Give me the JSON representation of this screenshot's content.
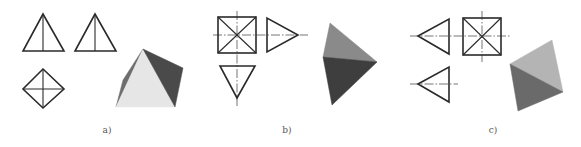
{
  "figure": {
    "panels": [
      {
        "id": "a",
        "label": "a)",
        "description": "Square pyramid: front view, side view, top view and shaded 3D view",
        "views": {
          "front": {
            "type": "triangle-with-vertical-edge",
            "points": [
              [
                43,
                14
              ],
              [
                23,
                51
              ],
              [
                64,
                51
              ]
            ],
            "inner_line": [
              [
                43,
                14
              ],
              [
                43,
                51
              ]
            ]
          },
          "side": {
            "type": "triangle-with-vertical-edge",
            "points": [
              [
                95,
                14
              ],
              [
                75,
                51
              ],
              [
                116,
                51
              ]
            ],
            "inner_line": [
              [
                95,
                14
              ],
              [
                95,
                51
              ]
            ]
          },
          "top": {
            "type": "diamond-with-cross",
            "points": [
              [
                43,
                69
              ],
              [
                64,
                89
              ],
              [
                43,
                108
              ],
              [
                23,
                89
              ]
            ]
          }
        },
        "solid": {
          "faces": [
            {
              "name": "left-face",
              "points": [
                [
                  143,
                  49
                ],
                [
                  123,
                  80
                ],
                [
                  116,
                  107
                ]
              ],
              "color": "#6e6e6e"
            },
            {
              "name": "front-face",
              "points": [
                [
                  143,
                  49
                ],
                [
                  116,
                  107
                ],
                [
                  175,
                  107
                ]
              ],
              "color": "#e6e6e6"
            },
            {
              "name": "right-face",
              "points": [
                [
                  143,
                  49
                ],
                [
                  183,
                  68
                ],
                [
                  175,
                  107
                ]
              ],
              "color": "#4a4a4a"
            }
          ]
        }
      },
      {
        "id": "b",
        "label": "b)",
        "description": "Square pyramid viewed from above: top view (square with diagonals), right-pointing side view, down-pointing front view, shaded 3D view",
        "views": {
          "square": {
            "type": "square-with-diagonals",
            "x": 218,
            "y": 17,
            "w": 38,
            "h": 36
          },
          "right": {
            "type": "triangle",
            "points": [
              [
                267,
                18
              ],
              [
                267,
                52
              ],
              [
                298,
                35
              ]
            ]
          },
          "bottom": {
            "type": "triangle",
            "points": [
              [
                220,
                66
              ],
              [
                255,
                66
              ],
              [
                237,
                98
              ]
            ]
          }
        },
        "centerlines": [
          {
            "from": [
              213,
              35
            ],
            "to": [
              308,
              35
            ]
          },
          {
            "from": [
              237,
              11
            ],
            "to": [
              237,
              106
            ]
          }
        ],
        "solid": {
          "faces": [
            {
              "name": "upper-face",
              "points": [
                [
                  330,
                  23
                ],
                [
                  323,
                  57
                ],
                [
                  377,
                  62
                ]
              ],
              "color": "#8a8a8a"
            },
            {
              "name": "lower-face",
              "points": [
                [
                  323,
                  57
                ],
                [
                  377,
                  62
                ],
                [
                  332,
                  105
                ]
              ],
              "color": "#3e3e3e"
            }
          ]
        }
      },
      {
        "id": "c",
        "label": "c)",
        "description": "Square pyramid viewed from the side: left-pointing side views and square top view, shaded 3D view",
        "views": {
          "left-top": {
            "type": "triangle",
            "points": [
              [
                418,
                36
              ],
              [
                449,
                19
              ],
              [
                449,
                54
              ]
            ]
          },
          "square": {
            "type": "square-with-diagonals",
            "x": 463,
            "y": 18,
            "w": 38,
            "h": 37
          },
          "left-bottom": {
            "type": "triangle",
            "points": [
              [
                418,
                84
              ],
              [
                449,
                67
              ],
              [
                449,
                102
              ]
            ]
          }
        },
        "centerlines": [
          {
            "from": [
              410,
              36
            ],
            "to": [
              510,
              36
            ]
          },
          {
            "from": [
              482,
              11
            ],
            "to": [
              482,
              62
            ]
          },
          {
            "from": [
              410,
              84
            ],
            "to": [
              458,
              84
            ]
          }
        ],
        "solid": {
          "faces": [
            {
              "name": "upper-face",
              "points": [
                [
                  552,
                  40
                ],
                [
                  510,
                  64
                ],
                [
                  563,
                  92
                ]
              ],
              "color": "#b4b4b4"
            },
            {
              "name": "lower-face",
              "points": [
                [
                  510,
                  64
                ],
                [
                  563,
                  92
                ],
                [
                  518,
                  111
                ]
              ],
              "color": "#6a6a6a"
            }
          ]
        }
      }
    ]
  },
  "labels": {
    "a": {
      "text": "a)",
      "x": 107,
      "y": 125
    },
    "b": {
      "text": "b)",
      "x": 287,
      "y": 125
    },
    "c": {
      "text": "c)",
      "x": 493,
      "y": 125
    }
  },
  "colors": {
    "background": "#ffffff",
    "line": "#2a2a2a",
    "label": "#555555"
  }
}
